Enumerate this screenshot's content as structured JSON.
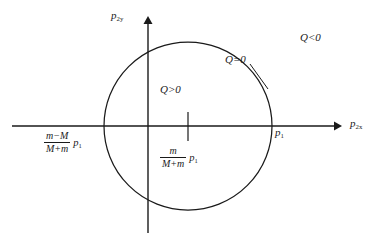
{
  "figure": {
    "background_color": "#ffffff",
    "stroke_color": "#1a1a1a",
    "axes": {
      "x_axis": {
        "name": "horizontal-axis",
        "label_text": "p",
        "label_sub": "2x",
        "arrow": "right",
        "x_start": 12,
        "x_end": 342,
        "y": 126
      },
      "y_axis": {
        "name": "vertical-axis",
        "label_text": "p",
        "label_sub": "2y",
        "arrow": "up",
        "x": 148,
        "y_start": 16,
        "y_end": 233
      }
    },
    "circle": {
      "name": "q-zero-circle",
      "center_x": 188,
      "center_y": 126,
      "radius": 84,
      "meaning": "Q=0"
    },
    "center_tick": {
      "name": "circle-center-tick",
      "x": 188,
      "y_top": 112,
      "y_bottom": 141
    },
    "leader_line": {
      "name": "q-zero-leader-line",
      "x1": 250,
      "y1": 64,
      "x2": 267,
      "y2": 88
    },
    "labels": {
      "axis_y": {
        "base": "p",
        "sub": "2y"
      },
      "axis_x": {
        "base": "p",
        "sub": "2x"
      },
      "q_negative": "Q<0",
      "q_positive": "Q>0",
      "q_zero": "Q=0",
      "p1_right": {
        "base": "p",
        "sub": "1"
      },
      "left_intercept": {
        "numerator": "m−M",
        "denominator": "M+m",
        "tail_base": "p",
        "tail_sub": "1"
      },
      "center_offset": {
        "numerator": "m",
        "denominator": "M+m",
        "tail_base": "p",
        "tail_sub": "1"
      }
    }
  }
}
